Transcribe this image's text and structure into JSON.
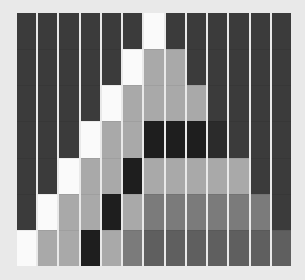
{
  "palette": {
    "D": "#3b3b3b",
    "W": "#fafafa",
    "L": "#a9a9a9",
    "B": "#1e1e1e",
    "K": "#2b2b2b",
    "M": "#7b7b7b",
    "S": "#5f5f5f"
  },
  "grid": {
    "columns": 13,
    "rows": 7,
    "cells": [
      [
        "D",
        "D",
        "D",
        "D",
        "D",
        "D",
        "W",
        "D",
        "D",
        "D",
        "D",
        "D",
        "D"
      ],
      [
        "D",
        "D",
        "D",
        "D",
        "D",
        "W",
        "L",
        "L",
        "D",
        "D",
        "D",
        "D",
        "D"
      ],
      [
        "D",
        "D",
        "D",
        "D",
        "W",
        "L",
        "L",
        "L",
        "L",
        "D",
        "D",
        "D",
        "D"
      ],
      [
        "D",
        "D",
        "D",
        "W",
        "L",
        "L",
        "B",
        "B",
        "B",
        "K",
        "D",
        "D",
        "D"
      ],
      [
        "D",
        "D",
        "W",
        "L",
        "L",
        "B",
        "L",
        "L",
        "L",
        "L",
        "L",
        "D",
        "D"
      ],
      [
        "D",
        "W",
        "L",
        "L",
        "B",
        "L",
        "M",
        "M",
        "M",
        "M",
        "M",
        "M",
        "D"
      ],
      [
        "W",
        "L",
        "L",
        "B",
        "L",
        "M",
        "S",
        "S",
        "S",
        "S",
        "S",
        "S",
        "S"
      ]
    ]
  }
}
